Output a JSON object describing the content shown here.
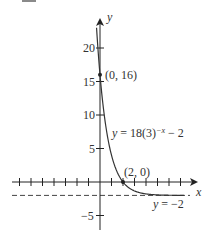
{
  "chart_data": {
    "type": "line",
    "title": "",
    "xlabel": "x",
    "ylabel": "y",
    "xlim": [
      -8,
      8
    ],
    "ylim": [
      -7,
      22
    ],
    "grid": false,
    "x_ticks": [
      -7,
      -6,
      -5,
      -4,
      -3,
      -2,
      -1,
      1,
      2,
      3,
      4,
      5,
      6,
      7
    ],
    "y_tick_labels": [
      {
        "value": 20,
        "label": "20"
      },
      {
        "value": 15,
        "label": "15"
      },
      {
        "value": 10,
        "label": "10"
      },
      {
        "value": 5,
        "label": "5"
      },
      {
        "value": -5,
        "label": "−5"
      }
    ],
    "series": [
      {
        "name": "y = 18(3)^(−x) − 2",
        "function": "18*3^(-x)-2",
        "x": [
          -0.3,
          0,
          0.5,
          1,
          1.5,
          2,
          3,
          4,
          5,
          6,
          7
        ],
        "values": [
          21.6,
          16,
          8.39,
          4,
          1.46,
          0,
          -1.33,
          -1.78,
          -1.93,
          -1.98,
          -1.99
        ]
      }
    ],
    "asymptote": {
      "y": -2,
      "label": "y = −2",
      "style": "dashed"
    },
    "points": [
      {
        "x": 0,
        "y": 16,
        "label": "(0, 16)"
      },
      {
        "x": 2,
        "y": 0,
        "label": "(2, 0)"
      }
    ],
    "annotations": [
      {
        "text": "y = 18(3)",
        "superscript": "−x",
        "suffix": " − 2"
      }
    ]
  },
  "labels": {
    "x_axis": "x",
    "y_axis": "y",
    "point_intercept_y": "(0, 16)",
    "point_intercept_x": "(2, 0)",
    "equation_prefix": "y",
    "equation_main": " = 18(3)",
    "equation_exp": "−x",
    "equation_suffix": " − 2",
    "asymptote": "y = −2",
    "tick_20": "20",
    "tick_15": "15",
    "tick_10": "10",
    "tick_5": "5",
    "tick_neg5": "−5"
  }
}
